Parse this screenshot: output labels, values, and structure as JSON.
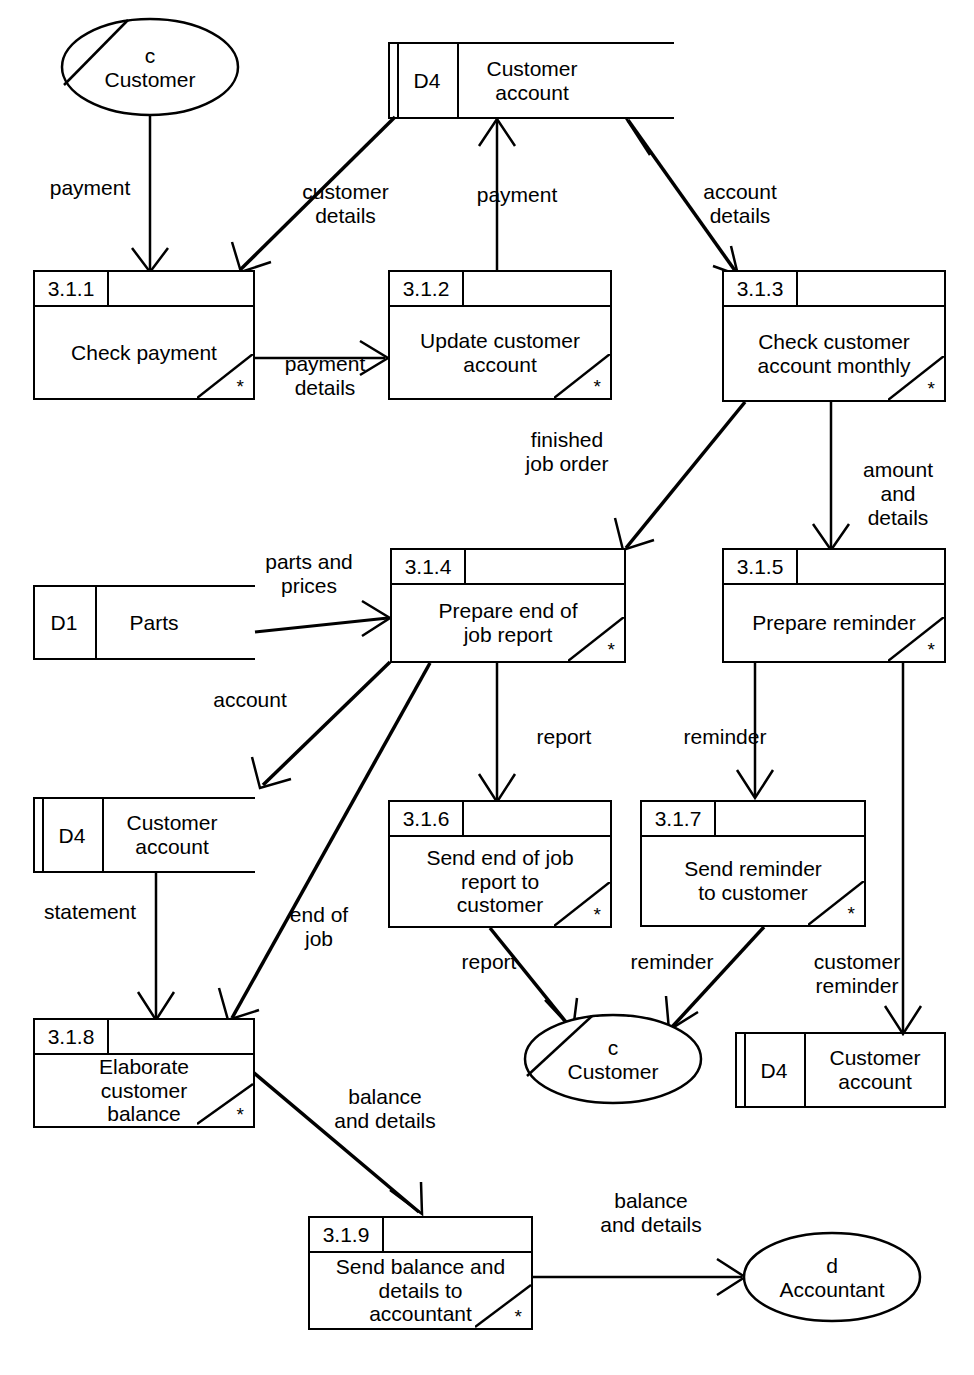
{
  "diagram": {
    "stroke_color": "#000000",
    "background_color": "#ffffff"
  },
  "processes": [
    {
      "id": "3.1.1",
      "name": "Check payment",
      "marker": "*"
    },
    {
      "id": "3.1.2",
      "name": "Update customer\naccount",
      "marker": "*"
    },
    {
      "id": "3.1.3",
      "name": "Check customer\naccount monthly",
      "marker": "*"
    },
    {
      "id": "3.1.4",
      "name": "Prepare end of\njob report",
      "marker": "*"
    },
    {
      "id": "3.1.5",
      "name": "Prepare reminder",
      "marker": "*"
    },
    {
      "id": "3.1.6",
      "name": "Send end of job\nreport to\ncustomer",
      "marker": "*"
    },
    {
      "id": "3.1.7",
      "name": "Send reminder\nto customer",
      "marker": "*"
    },
    {
      "id": "3.1.8",
      "name": "Elaborate\ncustomer\nbalance",
      "marker": "*"
    },
    {
      "id": "3.1.9",
      "name": "Send balance and\ndetails to\naccountant",
      "marker": "*"
    }
  ],
  "data_stores": [
    {
      "id": "D4",
      "name": "Customer\naccount",
      "position": "top"
    },
    {
      "id": "D1",
      "name": "Parts",
      "position": "middle-left"
    },
    {
      "id": "D4",
      "name": "Customer\naccount",
      "position": "lower-left"
    },
    {
      "id": "D4",
      "name": "Customer\naccount",
      "position": "bottom-right"
    }
  ],
  "external_entities": [
    {
      "id": "c",
      "name": "Customer",
      "position": "top-left"
    },
    {
      "id": "c",
      "name": "Customer",
      "position": "bottom-middle"
    },
    {
      "id": "d",
      "name": "Accountant",
      "position": "bottom-right"
    }
  ],
  "flows": [
    {
      "label": "payment",
      "from": "c Customer",
      "to": "3.1.1"
    },
    {
      "label": "customer\ndetails",
      "from": "D4 Customer account",
      "to": "3.1.1"
    },
    {
      "label": "payment\ndetails",
      "from": "3.1.1",
      "to": "3.1.2"
    },
    {
      "label": "payment",
      "from": "3.1.2",
      "to": "D4 Customer account"
    },
    {
      "label": "account\ndetails",
      "from": "D4 Customer account",
      "to": "3.1.3"
    },
    {
      "label": "finished\njob order",
      "from": "3.1.3",
      "to": "3.1.4"
    },
    {
      "label": "amount\nand\ndetails",
      "from": "3.1.3",
      "to": "3.1.5"
    },
    {
      "label": "parts and\nprices",
      "from": "D1 Parts",
      "to": "3.1.4"
    },
    {
      "label": "account",
      "from": "3.1.4",
      "to": "D4 Customer account"
    },
    {
      "label": "report",
      "from": "3.1.4",
      "to": "3.1.6"
    },
    {
      "label": "end of\njob",
      "from": "3.1.4",
      "to": "3.1.8"
    },
    {
      "label": "reminder",
      "from": "3.1.5",
      "to": "3.1.7"
    },
    {
      "label": "customer\nreminder",
      "from": "3.1.5",
      "to": "D4 Customer account"
    },
    {
      "label": "statement",
      "from": "D4 Customer account",
      "to": "3.1.8"
    },
    {
      "label": "report",
      "from": "3.1.6",
      "to": "c Customer"
    },
    {
      "label": "reminder",
      "from": "3.1.7",
      "to": "c Customer"
    },
    {
      "label": "balance\nand details",
      "from": "3.1.8",
      "to": "3.1.9"
    },
    {
      "label": "balance\nand details",
      "from": "3.1.9",
      "to": "d Accountant"
    }
  ],
  "labels": {
    "payment_top": "payment",
    "customer_details": "customer\ndetails",
    "payment_up": "payment",
    "account_details": "account\ndetails",
    "payment_details": "payment\ndetails",
    "finished_job_order": "finished\njob order",
    "amount_and_details": "amount\nand\ndetails",
    "parts_and_prices": "parts and\nprices",
    "account": "account",
    "report_mid": "report",
    "reminder_mid": "reminder",
    "statement": "statement",
    "end_of_job": "end of\njob",
    "report_low": "report",
    "reminder_low": "reminder",
    "customer_reminder": "customer\nreminder",
    "balance_and_details_1": "balance\nand details",
    "balance_and_details_2": "balance\nand details"
  }
}
